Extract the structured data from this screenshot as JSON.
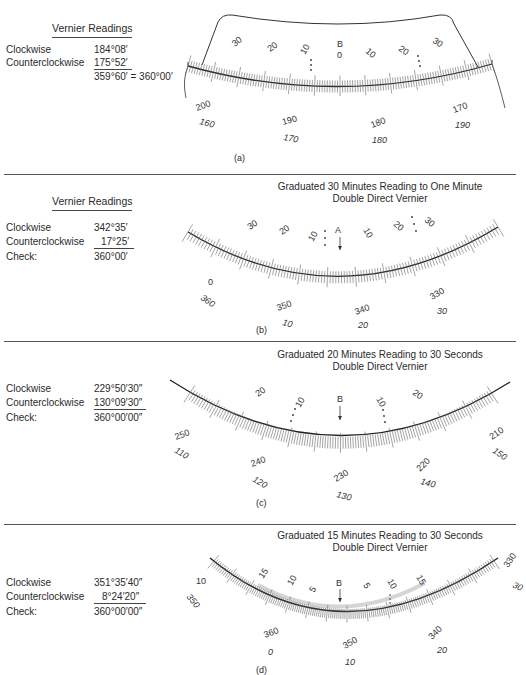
{
  "panels": [
    {
      "id": "a",
      "caption": "(a)",
      "title_line1": "",
      "title_line2": "",
      "readings_header": "Vernier Readings",
      "readings": [
        {
          "label": "Clockwise",
          "value": "184°08′"
        },
        {
          "label": "Counterclockwise",
          "value": "175°52′"
        },
        {
          "label": "",
          "value": "359°60′ = 360°00′"
        }
      ],
      "index_letter": "B",
      "vernier_labels": [
        "30",
        "20",
        "10",
        "0",
        "10",
        "20",
        "30"
      ],
      "main_scale_outer": [
        "200",
        "190",
        "180",
        "170"
      ],
      "main_scale_inner": [
        "160",
        "170",
        "180",
        "190"
      ]
    },
    {
      "id": "b",
      "caption": "(b)",
      "title_line1": "Graduated 30 Minutes Reading to One Minute",
      "title_line2": "Double Direct Vernier",
      "readings_header": "Vernier Readings",
      "readings": [
        {
          "label": "Clockwise",
          "value": "342°35′"
        },
        {
          "label": "Counterclockwise",
          "value": "17°25′"
        },
        {
          "label": "Check:",
          "value": "360°00′"
        }
      ],
      "index_letter": "A",
      "vernier_labels": [
        "30",
        "20",
        "10",
        "10",
        "20",
        "30"
      ],
      "main_scale_outer": [
        "0",
        "350",
        "340",
        "330"
      ],
      "main_scale_inner": [
        "360",
        "10",
        "20",
        "30"
      ]
    },
    {
      "id": "c",
      "caption": "(c)",
      "title_line1": "Graduated 20 Minutes Reading to 30 Seconds",
      "title_line2": "Double Direct Vernier",
      "readings_header": "",
      "readings": [
        {
          "label": "Clockwise",
          "value": "229°50′30″"
        },
        {
          "label": "Counterclockwise",
          "value": "130°09′30″"
        },
        {
          "label": "Check:",
          "value": "360°00′00″"
        }
      ],
      "index_letter": "B",
      "vernier_labels": [
        "20",
        "10",
        "10",
        "20"
      ],
      "main_scale_outer": [
        "250",
        "240",
        "230",
        "220",
        "210"
      ],
      "main_scale_inner": [
        "110",
        "120",
        "130",
        "140",
        "150"
      ]
    },
    {
      "id": "d",
      "caption": "(d)",
      "title_line1": "Graduated 15 Minutes Reading to 30 Seconds",
      "title_line2": "Double Direct Vernier",
      "readings_header": "",
      "readings": [
        {
          "label": "Clockwise",
          "value": "351°35′40″"
        },
        {
          "label": "Counterclockwise",
          "value": "8°24′20″"
        },
        {
          "label": "Check:",
          "value": "360°00′00″"
        }
      ],
      "index_letter": "B",
      "vernier_labels": [
        "15",
        "10",
        "5",
        "5",
        "10",
        "15"
      ],
      "main_scale_outer": [
        "10",
        "360",
        "350",
        "340",
        "330"
      ],
      "main_scale_inner": [
        "350",
        "0",
        "10",
        "20",
        "30"
      ]
    }
  ]
}
